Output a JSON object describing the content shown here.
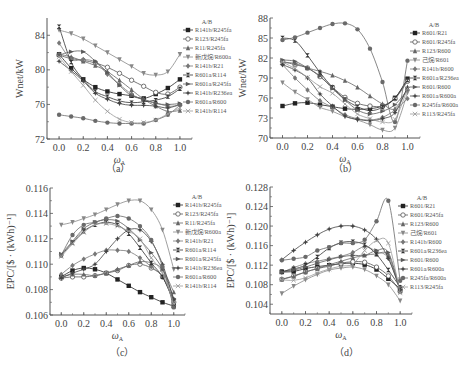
{
  "chart_data": [
    {
      "id": "a",
      "type": "line",
      "caption": "（a）",
      "xlabel": "ωA",
      "ylabel": "Wnet/kW",
      "ylim": [
        72,
        86
      ],
      "yticks": [
        72,
        76,
        80,
        84
      ],
      "xticks": [
        0.0,
        0.2,
        0.4,
        0.6,
        0.8,
        1.0
      ],
      "legend_title": "A/B",
      "x": [
        0.0,
        0.1,
        0.2,
        0.3,
        0.4,
        0.5,
        0.6,
        0.7,
        0.8,
        0.9,
        1.0
      ],
      "series": [
        {
          "name": "R141b/R245fa",
          "marker": "square-filled",
          "values": [
            81.8,
            80.2,
            78.9,
            78.0,
            77.5,
            77.2,
            77.0,
            76.7,
            77.2,
            77.9,
            78.9
          ]
        },
        {
          "name": "R123/R245fa",
          "marker": "circle-open",
          "values": [
            81.7,
            81.3,
            81.1,
            80.8,
            80.3,
            79.6,
            78.8,
            78.1,
            77.4,
            77.2,
            78.0
          ]
        },
        {
          "name": "R11/R245fa",
          "marker": "triangle-up",
          "values": [
            81.8,
            81.5,
            81.0,
            80.5,
            79.8,
            78.8,
            77.7,
            76.6,
            75.8,
            75.2,
            75.3
          ]
        },
        {
          "name": "新戊烷/R600a",
          "marker": "triangle-down",
          "values": [
            84.6,
            84.2,
            83.6,
            82.8,
            82.0,
            81.2,
            80.4,
            79.6,
            79.4,
            79.8,
            81.8
          ]
        },
        {
          "name": "R141b/R21",
          "marker": "diamond",
          "values": [
            83.1,
            81.2,
            81.2,
            80.9,
            79.5,
            78.3,
            77.2,
            76.5,
            76.2,
            75.8,
            75.9
          ]
        },
        {
          "name": "R601a/R114",
          "marker": "hourglass",
          "values": [
            85.0,
            80.9,
            78.9,
            77.5,
            76.9,
            76.4,
            76.2,
            76.3,
            76.5,
            76.9,
            77.8
          ]
        },
        {
          "name": "R601a/R245fa",
          "marker": "triangle-right",
          "values": [
            81.7,
            82.1,
            82.1,
            81.0,
            79.7,
            78.2,
            77.0,
            76.6,
            76.1,
            76.0,
            76.1
          ]
        },
        {
          "name": "R141b/R236ea",
          "marker": "star",
          "values": [
            81.0,
            79.9,
            78.7,
            77.3,
            76.6,
            76.1,
            75.9,
            75.9,
            75.8,
            75.6,
            76.0
          ]
        },
        {
          "name": "R601a/R600",
          "marker": "circle-filled",
          "values": [
            74.8,
            74.6,
            74.4,
            74.1,
            73.9,
            73.8,
            73.8,
            73.8,
            74.2,
            74.8,
            75.9
          ]
        },
        {
          "name": "R141b/R114",
          "marker": "x-cross",
          "values": [
            81.5,
            79.8,
            78.2,
            76.5,
            75.2,
            74.3,
            73.9,
            73.9,
            74.2,
            74.9,
            75.6
          ]
        }
      ]
    },
    {
      "id": "b",
      "type": "line",
      "caption": "（b）",
      "xlabel": "ωA",
      "ylabel": "Wnet/kW",
      "ylim": [
        70,
        88
      ],
      "yticks": [
        70,
        73,
        76,
        79,
        82,
        85,
        88
      ],
      "xticks": [
        0.0,
        0.2,
        0.4,
        0.6,
        0.8,
        1.0
      ],
      "legend_title": "A/B",
      "x": [
        0.0,
        0.1,
        0.2,
        0.3,
        0.4,
        0.5,
        0.6,
        0.7,
        0.8,
        0.9,
        1.0
      ],
      "series": [
        {
          "name": "R601/R21",
          "marker": "square-filled",
          "values": [
            74.8,
            75.2,
            75.3,
            75.0,
            74.7,
            74.4,
            74.3,
            74.4,
            74.8,
            76.0,
            78.9
          ]
        },
        {
          "name": "R601/R245fa",
          "marker": "circle-open",
          "values": [
            81.5,
            81.0,
            80.5,
            79.2,
            77.6,
            76.1,
            75.2,
            74.8,
            74.8,
            75.9,
            78.5
          ]
        },
        {
          "name": "R123/R600",
          "marker": "triangle-up",
          "values": [
            81.3,
            81.2,
            80.5,
            80.0,
            79.4,
            78.6,
            77.6,
            76.3,
            75.1,
            74.4,
            77.5
          ]
        },
        {
          "name": "己烷/R601",
          "marker": "triangle-down",
          "values": [
            78.3,
            76.9,
            75.8,
            74.6,
            74.0,
            73.2,
            72.7,
            72.0,
            71.2,
            71.5,
            76.8
          ]
        },
        {
          "name": "R141b/R600",
          "marker": "diamond",
          "values": [
            81.0,
            79.0,
            77.2,
            75.6,
            74.6,
            73.5,
            72.9,
            72.7,
            73.1,
            74.2,
            75.9
          ]
        },
        {
          "name": "R601a/R236ea",
          "marker": "hourglass",
          "values": [
            85.0,
            84.6,
            82.4,
            79.8,
            77.6,
            75.8,
            74.7,
            74.1,
            74.6,
            76.0,
            78.7
          ]
        },
        {
          "name": "R601/R600",
          "marker": "triangle-right",
          "values": [
            81.7,
            81.5,
            80.5,
            79.3,
            77.4,
            75.7,
            74.2,
            73.6,
            74.0,
            75.0,
            77.2
          ]
        },
        {
          "name": "R601a/R600a",
          "marker": "star",
          "values": [
            81.0,
            80.2,
            79.0,
            76.6,
            74.8,
            73.3,
            72.8,
            72.6,
            72.9,
            73.8,
            77.6
          ]
        },
        {
          "name": "R245fa/R600a",
          "marker": "circle-filled",
          "values": [
            84.7,
            85.1,
            85.8,
            86.5,
            87.1,
            87.2,
            86.3,
            83.4,
            78.4,
            72.4,
            81.6
          ]
        },
        {
          "name": "R113/R245fa",
          "marker": "x-cross",
          "values": [
            81.4,
            80.4,
            79.1,
            77.7,
            76.7,
            75.1,
            73.6,
            72.9,
            72.4,
            72.8,
            77.4
          ]
        }
      ]
    },
    {
      "id": "c",
      "type": "line",
      "caption": "（c）",
      "xlabel": "ωA",
      "ylabel": "EPC/[$ · (kWh)⁻¹]",
      "ylim": [
        0.106,
        0.116
      ],
      "yticks": [
        0.106,
        0.108,
        0.11,
        0.112,
        0.114,
        0.116
      ],
      "xticks": [
        0.0,
        0.2,
        0.4,
        0.6,
        0.8,
        1.0
      ],
      "legend_title": "A/B",
      "x": [
        0.0,
        0.1,
        0.2,
        0.3,
        0.4,
        0.5,
        0.6,
        0.7,
        0.8,
        0.9,
        1.0
      ],
      "series": [
        {
          "name": "R141b/R245fa",
          "marker": "square-filled",
          "values": [
            0.109,
            0.1095,
            0.1097,
            0.1096,
            0.1093,
            0.1088,
            0.1083,
            0.1078,
            0.1074,
            0.107,
            0.1067
          ]
        },
        {
          "name": "R123/R245fa",
          "marker": "circle-open",
          "values": [
            0.1089,
            0.109,
            0.109,
            0.1091,
            0.1093,
            0.1095,
            0.1099,
            0.11,
            0.1097,
            0.109,
            0.107
          ]
        },
        {
          "name": "R11/R245fa",
          "marker": "triangle-up",
          "values": [
            0.109,
            0.1092,
            0.1092,
            0.1091,
            0.1093,
            0.1096,
            0.1099,
            0.1102,
            0.1101,
            0.1096,
            0.1078
          ]
        },
        {
          "name": "新戊烷/R600a",
          "marker": "triangle-down",
          "values": [
            0.1131,
            0.1133,
            0.1136,
            0.1139,
            0.1143,
            0.1147,
            0.115,
            0.115,
            0.1143,
            0.1127,
            0.1096
          ]
        },
        {
          "name": "R141b/R21",
          "marker": "diamond",
          "values": [
            0.1092,
            0.1099,
            0.1104,
            0.1108,
            0.1111,
            0.1111,
            0.111,
            0.1105,
            0.1098,
            0.109,
            0.1072
          ]
        },
        {
          "name": "R601a/R114",
          "marker": "hourglass",
          "values": [
            0.1107,
            0.1117,
            0.1126,
            0.1131,
            0.1133,
            0.1131,
            0.1124,
            0.1113,
            0.1101,
            0.109,
            0.1071
          ]
        },
        {
          "name": "R601a/R245fa",
          "marker": "triangle-right",
          "values": [
            0.1108,
            0.1118,
            0.1128,
            0.1133,
            0.1135,
            0.1134,
            0.1128,
            0.1119,
            0.1109,
            0.1096,
            0.1073
          ]
        },
        {
          "name": "R141b/R236ea",
          "marker": "star",
          "values": [
            0.1089,
            0.1093,
            0.1096,
            0.11,
            0.111,
            0.112,
            0.1127,
            0.1127,
            0.1118,
            0.11,
            0.1072
          ]
        },
        {
          "name": "R601a/R600",
          "marker": "circle-filled",
          "values": [
            0.1107,
            0.1123,
            0.1131,
            0.1133,
            0.1136,
            0.1138,
            0.1136,
            0.113,
            0.1119,
            0.1098,
            0.1066
          ]
        },
        {
          "name": "R141b/R114",
          "marker": "x-cross",
          "values": [
            0.1106,
            0.1116,
            0.1125,
            0.1131,
            0.1132,
            0.113,
            0.1126,
            0.112,
            0.1105,
            0.1093,
            0.1069
          ]
        }
      ]
    },
    {
      "id": "d",
      "type": "line",
      "caption": "（d）",
      "xlabel": "ωA",
      "ylabel": "EPC/[$ · (kWh)⁻¹]",
      "ylim": [
        0.102,
        0.128
      ],
      "yticks": [
        0.104,
        0.108,
        0.112,
        0.116,
        0.12,
        0.124,
        0.128
      ],
      "xticks": [
        0.0,
        0.2,
        0.4,
        0.6,
        0.8,
        1.0
      ],
      "legend_title": "A/B",
      "x": [
        0.0,
        0.1,
        0.2,
        0.3,
        0.4,
        0.5,
        0.6,
        0.7,
        0.8,
        0.9,
        1.0
      ],
      "series": [
        {
          "name": "R601/R21",
          "marker": "square-filled",
          "values": [
            0.1106,
            0.1107,
            0.1113,
            0.1117,
            0.112,
            0.1123,
            0.1124,
            0.1121,
            0.1111,
            0.1092,
            0.1072
          ]
        },
        {
          "name": "R601/R245fa",
          "marker": "circle-open",
          "values": [
            0.1091,
            0.1098,
            0.1106,
            0.1113,
            0.1118,
            0.1124,
            0.1127,
            0.1126,
            0.1116,
            0.1098,
            0.1066
          ]
        },
        {
          "name": "R123/R600",
          "marker": "triangle-up",
          "values": [
            0.1091,
            0.1097,
            0.1106,
            0.1113,
            0.1121,
            0.1128,
            0.1135,
            0.114,
            0.1143,
            0.114,
            0.1067
          ]
        },
        {
          "name": "己烷/R601",
          "marker": "triangle-down",
          "values": [
            0.1062,
            0.1077,
            0.109,
            0.1101,
            0.111,
            0.1114,
            0.1116,
            0.1111,
            0.1098,
            0.108,
            0.1047
          ]
        },
        {
          "name": "R141b/R600",
          "marker": "diamond",
          "values": [
            0.1105,
            0.1115,
            0.1123,
            0.1128,
            0.1133,
            0.1138,
            0.1146,
            0.1158,
            0.1148,
            0.1134,
            0.1068
          ]
        },
        {
          "name": "R601a/R236ea",
          "marker": "hourglass",
          "values": [
            0.1107,
            0.1112,
            0.112,
            0.1137,
            0.1155,
            0.1166,
            0.1168,
            0.1162,
            0.1142,
            0.111,
            0.1075
          ]
        },
        {
          "name": "R601/R600",
          "marker": "triangle-right",
          "values": [
            0.1106,
            0.111,
            0.1116,
            0.1124,
            0.1131,
            0.1137,
            0.114,
            0.114,
            0.115,
            0.1146,
            0.1069
          ]
        },
        {
          "name": "R601a/R600a",
          "marker": "star",
          "values": [
            0.1131,
            0.115,
            0.1167,
            0.1182,
            0.1194,
            0.12,
            0.12,
            0.1192,
            0.1173,
            0.1134,
            0.107
          ]
        },
        {
          "name": "R245fa/R600a",
          "marker": "circle-filled",
          "values": [
            0.113,
            0.1133,
            0.1137,
            0.115,
            0.1157,
            0.1165,
            0.1165,
            0.1172,
            0.121,
            0.1252,
            0.1088
          ]
        },
        {
          "name": "R113/R245fa",
          "marker": "x-cross",
          "values": [
            0.109,
            0.1089,
            0.1094,
            0.1104,
            0.1112,
            0.1118,
            0.1122,
            0.115,
            0.117,
            0.1165,
            0.1063
          ]
        }
      ]
    }
  ],
  "layout": [
    {
      "id": "a",
      "x0": 47,
      "x1": 192,
      "y0": 18,
      "y1": 139,
      "legend_x": 183,
      "legend_y": 24
    },
    {
      "id": "b",
      "x0": 270,
      "x1": 420,
      "y0": 18,
      "y1": 138,
      "legend_x": 410,
      "legend_y": 27
    },
    {
      "id": "c",
      "x0": 50,
      "x1": 185,
      "y0": 188,
      "y1": 315,
      "legend_x": 173,
      "legend_y": 199
    },
    {
      "id": "d",
      "x0": 270,
      "x1": 412,
      "y0": 187,
      "y1": 314,
      "legend_x": 398,
      "legend_y": 200
    }
  ],
  "captions": {
    "a": "（a）",
    "b": "（b）",
    "c": "（c）",
    "d": "（d）"
  }
}
